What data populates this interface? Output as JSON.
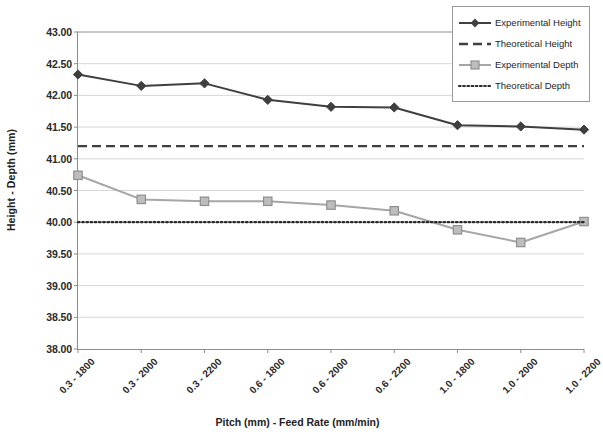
{
  "chart_data": {
    "type": "line",
    "title": "",
    "xlabel": "Pitch (mm) - Feed Rate (mm/min)",
    "ylabel": "Height - Depth (mm)",
    "ylim": [
      38.0,
      43.0
    ],
    "ytick_step": 0.5,
    "grid": true,
    "legend_position": "top-right",
    "categories": [
      "0.3 - 1800",
      "0.3 - 2000",
      "0.3 - 2200",
      "0.6 - 1800",
      "0.6 - 2000",
      "0.6 - 2200",
      "1.0 - 1800",
      "1.0 - 2000",
      "1.0 - 2200"
    ],
    "ytick_labels": [
      "43.00",
      "42.50",
      "42.00",
      "41.50",
      "41.00",
      "40.50",
      "40.00",
      "39.50",
      "39.00",
      "38.50",
      "38.00"
    ],
    "ytick_values": [
      43.0,
      42.5,
      42.0,
      41.5,
      41.0,
      40.5,
      40.0,
      39.5,
      39.0,
      38.5,
      38.0
    ],
    "series": [
      {
        "name": "Experimental Height",
        "style": "solid",
        "marker": "diamond",
        "color": "#3f3f3f",
        "values": [
          42.33,
          42.15,
          42.19,
          41.93,
          41.82,
          41.81,
          41.53,
          41.51,
          41.46
        ]
      },
      {
        "name": "Theoretical Height",
        "style": "dashed",
        "marker": "none",
        "color": "#3f3f3f",
        "constant": 41.2,
        "values": [
          41.2,
          41.2,
          41.2,
          41.2,
          41.2,
          41.2,
          41.2,
          41.2,
          41.2
        ]
      },
      {
        "name": "Experimental Depth",
        "style": "solid",
        "marker": "square",
        "color": "#a6a6a6",
        "values": [
          40.74,
          40.36,
          40.33,
          40.33,
          40.27,
          40.18,
          39.88,
          39.68,
          40.01
        ]
      },
      {
        "name": "Theoretical Depth",
        "style": "dotted",
        "marker": "none",
        "color": "#2b2b2b",
        "constant": 40.0,
        "values": [
          40.0,
          40.0,
          40.0,
          40.0,
          40.0,
          40.0,
          40.0,
          40.0,
          40.0
        ]
      }
    ]
  },
  "legend": {
    "items": [
      {
        "label": "Experimental Height"
      },
      {
        "label": "Theoretical Height"
      },
      {
        "label": "Experimental Depth"
      },
      {
        "label": "Theoretical Depth"
      }
    ]
  }
}
